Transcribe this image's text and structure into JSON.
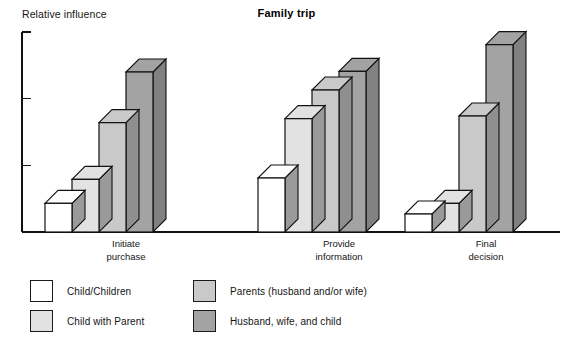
{
  "chart": {
    "title": "Family trip",
    "y_axis_label": "Relative influence"
  },
  "legend": {
    "left": [
      {
        "label": "Child/Children",
        "color": "#ffffff",
        "key": "child_children"
      },
      {
        "label": "Child with Parent",
        "color": "#e2e2e2",
        "key": "child_with_parent"
      }
    ],
    "right": [
      {
        "label": "Parents (husband and/or wife)",
        "color": "#c9c9c9",
        "key": "parents"
      },
      {
        "label": "Husband, wife, and child",
        "color": "#a3a3a3",
        "key": "husband_wife_child"
      }
    ]
  },
  "chart_data": {
    "type": "bar",
    "title": "Family trip",
    "xlabel": "",
    "ylabel": "Relative influence",
    "ylim": [
      0,
      3
    ],
    "y_ticks": [
      0,
      1,
      2,
      3
    ],
    "y_tick_labels": [
      "",
      "",
      "",
      ""
    ],
    "grid": false,
    "legend_position": "bottom",
    "style": "3d-extruded-bars",
    "categories": [
      "Initiate purchase",
      "Provide information",
      "Final decision"
    ],
    "category_lines": [
      [
        "Initiate",
        "purchase"
      ],
      [
        "Provide",
        "information"
      ],
      [
        "Final",
        "decision"
      ]
    ],
    "series": [
      {
        "name": "Child/Children",
        "color": "#ffffff",
        "side_color": "#9a9a9a",
        "values": [
          0.43,
          0.81,
          0.27
        ]
      },
      {
        "name": "Child with Parent",
        "color": "#e2e2e2",
        "side_color": "#9a9a9a",
        "values": [
          0.79,
          1.7,
          0.43
        ]
      },
      {
        "name": "Parents (husband and/or wife)",
        "color": "#c9c9c9",
        "side_color": "#8f8f8f",
        "values": [
          1.64,
          2.13,
          1.74
        ]
      },
      {
        "name": "Husband, wife, and child",
        "color": "#a3a3a3",
        "side_color": "#818181",
        "values": [
          2.4,
          2.41,
          2.81
        ]
      }
    ]
  }
}
